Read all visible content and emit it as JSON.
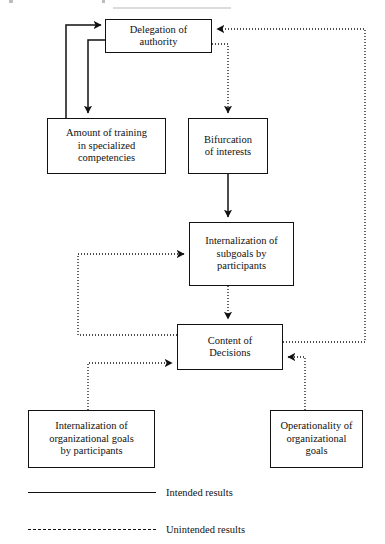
{
  "diagram": {
    "nodes": [
      {
        "id": "delegation",
        "label": "Delegation of\nauthority"
      },
      {
        "id": "training",
        "label": "Amount of training\nin specialized\ncompetencies"
      },
      {
        "id": "bifurcation",
        "label": "Bifurcation\nof interests"
      },
      {
        "id": "subgoals",
        "label": "Internalization of\nsubgoals by\nparticipants"
      },
      {
        "id": "content",
        "label": "Content of\nDecisions"
      },
      {
        "id": "internalization",
        "label": "Internalization of\norganizational goals\nby participants"
      },
      {
        "id": "operationality",
        "label": "Operationality of\norganizational\ngoals"
      }
    ],
    "edges": [
      {
        "from": "delegation",
        "to": "training",
        "style": "intended"
      },
      {
        "from": "training",
        "to": "delegation",
        "style": "intended"
      },
      {
        "from": "delegation",
        "to": "bifurcation",
        "style": "unintended"
      },
      {
        "from": "bifurcation",
        "to": "subgoals",
        "style": "intended"
      },
      {
        "from": "subgoals",
        "to": "content",
        "style": "unintended"
      },
      {
        "from": "content",
        "to": "subgoals",
        "style": "unintended"
      },
      {
        "from": "content",
        "to": "delegation",
        "style": "unintended"
      },
      {
        "from": "internalization",
        "to": "content",
        "style": "unintended"
      },
      {
        "from": "operationality",
        "to": "content",
        "style": "unintended"
      }
    ]
  },
  "legend": {
    "items": [
      {
        "id": "intended",
        "line": "solid",
        "label": "Intended results"
      },
      {
        "id": "unintended",
        "line": "dashed",
        "label": "Unintended results"
      }
    ]
  }
}
